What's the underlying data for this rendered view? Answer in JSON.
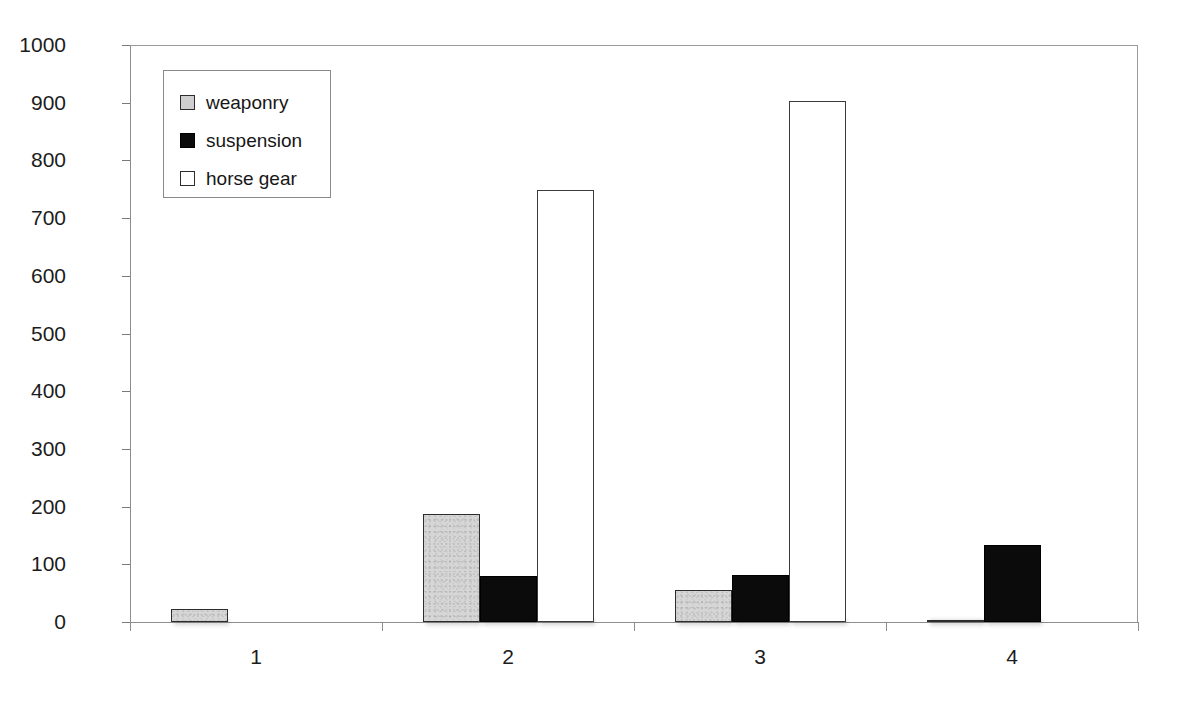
{
  "chart_data": {
    "type": "bar",
    "title": "",
    "xlabel": "",
    "ylabel": "",
    "categories": [
      "1",
      "2",
      "3",
      "4"
    ],
    "series": [
      {
        "name": "weaponry",
        "color": "#d6d6d6",
        "values": [
          23,
          188,
          55,
          4
        ]
      },
      {
        "name": "suspension",
        "color": "#0b0b0b",
        "values": [
          0,
          80,
          81,
          134
        ]
      },
      {
        "name": "horse gear",
        "color": "#ffffff",
        "values": [
          0,
          749,
          903,
          0
        ]
      }
    ],
    "ylim": [
      0,
      1000
    ],
    "ytick_step": 100,
    "yticks": [
      "1000",
      "900",
      "800",
      "700",
      "600",
      "500",
      "400",
      "300",
      "200",
      "100",
      "0"
    ],
    "grid": true,
    "legend_position": "top-left-inside",
    "plot_background": "#ffffff",
    "gridline_color": "#b4b4b4",
    "axis_color": "#8e8e8e"
  },
  "legend": {
    "entries": [
      {
        "label": "weaponry"
      },
      {
        "label": "suspension"
      },
      {
        "label": "horse gear"
      }
    ]
  }
}
